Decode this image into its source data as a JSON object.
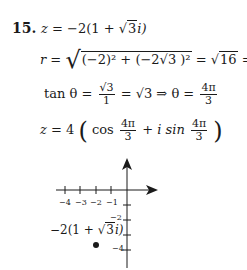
{
  "problem": {
    "number": "15.",
    "line1": {
      "lhs": "z",
      "eq": "=",
      "rhs_pre": "−2(1 + ",
      "rhs_sqrt": "3",
      "rhs_post": "i)"
    },
    "line2": {
      "lhs": "r",
      "eq": "=",
      "radicand": "(−2)² + (−2√3 )²",
      "result_pre": "= ",
      "result_sqrt": "16",
      "result_post": " = 4"
    },
    "line3": {
      "lhs": "tan θ",
      "eq": "=",
      "frac1_num": "√3",
      "frac1_den": "1",
      "mid": "= √3 ⇒ θ =",
      "frac2_num": "4π",
      "frac2_den": "3"
    },
    "line4": {
      "lhs": "z",
      "eq": "= 4",
      "cos": "cos",
      "frac_num": "4π",
      "frac_den": "3",
      "plus": "+",
      "isin": "i sin"
    }
  },
  "graph": {
    "x_ticks": [
      "−4",
      "−3",
      "−2",
      "−1"
    ],
    "y_ticks": [
      "−2",
      "−4"
    ],
    "point_label_pre": "−2(1 + ",
    "point_label_sqrt": "3",
    "point_label_post": "i)"
  }
}
